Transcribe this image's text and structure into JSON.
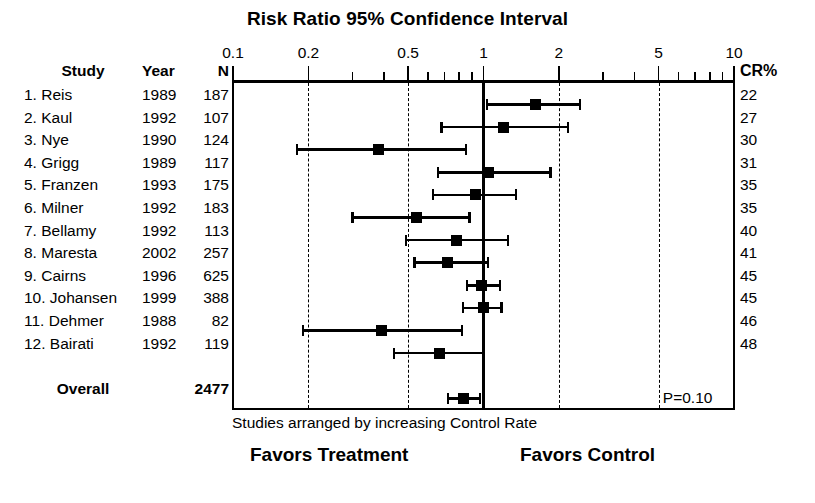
{
  "chart_data": {
    "type": "forest",
    "title": "Risk Ratio 95% Confidence Interval",
    "xlabel": "Studies arranged by increasing Control Rate",
    "xscale": "log",
    "xlim": [
      0.1,
      10
    ],
    "xticks": [
      0.1,
      0.2,
      0.5,
      1,
      2,
      5,
      10
    ],
    "xticklabels": [
      "0.1",
      "0.2",
      "0.5",
      "1",
      "2",
      "5",
      "10"
    ],
    "gridlines": [
      0.2,
      0.5,
      2,
      5
    ],
    "nullline": 1,
    "columns": [
      "Study",
      "Year",
      "N",
      "CR%"
    ],
    "rows": [
      {
        "study": "1. Reis",
        "year": "1989",
        "n": "187",
        "cr": "22",
        "rr": 1.62,
        "lo": 1.03,
        "hi": 2.42
      },
      {
        "study": "2. Kaul",
        "year": "1992",
        "n": "107",
        "cr": "27",
        "rr": 1.2,
        "lo": 0.68,
        "hi": 2.18
      },
      {
        "study": "3. Nye",
        "year": "1990",
        "n": "124",
        "cr": "30",
        "rr": 0.38,
        "lo": 0.18,
        "hi": 0.85
      },
      {
        "study": "4. Grigg",
        "year": "1989",
        "n": "117",
        "cr": "31",
        "rr": 1.05,
        "lo": 0.66,
        "hi": 1.85
      },
      {
        "study": "5. Franzen",
        "year": "1993",
        "n": "175",
        "cr": "35",
        "rr": 0.93,
        "lo": 0.63,
        "hi": 1.35
      },
      {
        "study": "6. Milner",
        "year": "1992",
        "n": "183",
        "cr": "35",
        "rr": 0.54,
        "lo": 0.3,
        "hi": 0.88
      },
      {
        "study": "7. Bellamy",
        "year": "1992",
        "n": "113",
        "cr": "40",
        "rr": 0.78,
        "lo": 0.49,
        "hi": 1.25
      },
      {
        "study": "8. Maresta",
        "year": "2002",
        "n": "257",
        "cr": "41",
        "rr": 0.72,
        "lo": 0.53,
        "hi": 1.04
      },
      {
        "study": "9. Cairns",
        "year": "1996",
        "n": "625",
        "cr": "45",
        "rr": 0.98,
        "lo": 0.86,
        "hi": 1.16
      },
      {
        "study": "10. Johansen",
        "year": "1999",
        "n": "388",
        "cr": "45",
        "rr": 1.0,
        "lo": 0.83,
        "hi": 1.18
      },
      {
        "study": "11. Dehmer",
        "year": "1988",
        "n": "82",
        "cr": "46",
        "rr": 0.39,
        "lo": 0.19,
        "hi": 0.82
      },
      {
        "study": "12. Bairati",
        "year": "1992",
        "n": "119",
        "cr": "48",
        "rr": 0.67,
        "lo": 0.44,
        "hi": 1.0
      }
    ],
    "overall": {
      "study": "Overall",
      "year": "",
      "n": "2477",
      "rr": 0.83,
      "lo": 0.72,
      "hi": 0.97
    },
    "annotations": {
      "pvalue": "P=0.10"
    },
    "footer_left": "Favors Treatment",
    "footer_right": "Favors Control"
  }
}
